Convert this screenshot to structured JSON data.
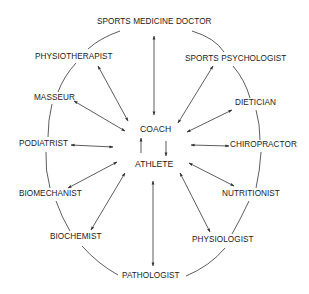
{
  "diagram": {
    "type": "hub-and-ring",
    "center": {
      "coach": "COACH",
      "athlete": "ATHLETE"
    },
    "ring_nodes": [
      {
        "id": "sports_medicine_doctor",
        "label": "SPORTS MEDICINE DOCTOR"
      },
      {
        "id": "sports_psychologist",
        "label": "SPORTS PSYCHOLOGIST"
      },
      {
        "id": "dietician",
        "label": "DIETICIAN"
      },
      {
        "id": "chiropractor",
        "label": "CHIROPRACTOR"
      },
      {
        "id": "nutritionist",
        "label": "NUTRITIONIST"
      },
      {
        "id": "physiologist",
        "label": "PHYSIOLOGIST"
      },
      {
        "id": "pathologist",
        "label": "PATHOLOGIST"
      },
      {
        "id": "biochemist",
        "label": "BIOCHEMIST"
      },
      {
        "id": "biomechanist",
        "label": "BIOMECHANIST"
      },
      {
        "id": "podiatrist",
        "label": "PODIATRIST"
      },
      {
        "id": "masseur",
        "label": "MASSEUR"
      },
      {
        "id": "physiotherapist",
        "label": "PHYSIOTHERAPIST"
      }
    ],
    "edges": [
      {
        "from": "sports_medicine_doctor",
        "to": "center",
        "style": "double-arrow"
      },
      {
        "from": "sports_psychologist",
        "to": "center",
        "style": "double-arrow"
      },
      {
        "from": "dietician",
        "to": "center",
        "style": "double-arrow"
      },
      {
        "from": "chiropractor",
        "to": "center",
        "style": "double-arrow"
      },
      {
        "from": "nutritionist",
        "to": "center",
        "style": "double-arrow"
      },
      {
        "from": "physiologist",
        "to": "center",
        "style": "double-arrow"
      },
      {
        "from": "pathologist",
        "to": "center",
        "style": "double-arrow"
      },
      {
        "from": "biochemist",
        "to": "center",
        "style": "double-arrow"
      },
      {
        "from": "biomechanist",
        "to": "center",
        "style": "double-arrow"
      },
      {
        "from": "podiatrist",
        "to": "center",
        "style": "double-arrow"
      },
      {
        "from": "masseur",
        "to": "center",
        "style": "double-arrow"
      },
      {
        "from": "physiotherapist",
        "to": "center",
        "style": "double-arrow"
      },
      {
        "from": "coach",
        "to": "athlete",
        "style": "two-way-vertical-arrows"
      }
    ],
    "ring": "curved lines connecting adjacent outer nodes forming a closed loop"
  },
  "colors": {
    "line": "#333333",
    "text": "#222222",
    "background": "#ffffff"
  }
}
